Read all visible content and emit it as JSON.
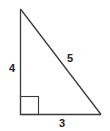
{
  "diagram": {
    "type": "right-triangle",
    "sides": {
      "vertical": {
        "label": "4",
        "length": 4
      },
      "horizontal": {
        "label": "3",
        "length": 3
      },
      "hypotenuse": {
        "label": "5",
        "length": 5
      }
    },
    "right_angle_marker": true,
    "colors": {
      "stroke": "#3a3a3a",
      "label": "#222222",
      "background": "#ffffff"
    }
  }
}
